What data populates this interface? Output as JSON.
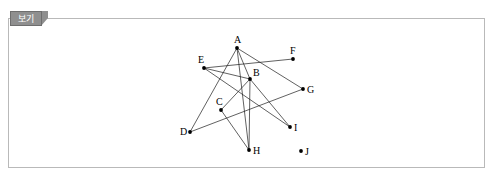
{
  "panel": {
    "tab_label": "보기"
  },
  "graph": {
    "title": "",
    "vertices": [
      {
        "id": "A",
        "label": "A",
        "x": 237,
        "y": 48,
        "label_x": 234,
        "label_y": 43
      },
      {
        "id": "B",
        "label": "B",
        "x": 250,
        "y": 79,
        "label_x": 253,
        "label_y": 76
      },
      {
        "id": "C",
        "label": "C",
        "x": 221,
        "y": 110,
        "label_x": 216,
        "label_y": 105
      },
      {
        "id": "D",
        "label": "D",
        "x": 190,
        "y": 132,
        "label_x": 180,
        "label_y": 135
      },
      {
        "id": "E",
        "label": "E",
        "x": 204,
        "y": 68,
        "label_x": 198,
        "label_y": 63
      },
      {
        "id": "F",
        "label": "F",
        "x": 293,
        "y": 59,
        "label_x": 290,
        "label_y": 54
      },
      {
        "id": "G",
        "label": "G",
        "x": 303,
        "y": 89,
        "label_x": 307,
        "label_y": 93
      },
      {
        "id": "H",
        "label": "H",
        "x": 249,
        "y": 150,
        "label_x": 253,
        "label_y": 154
      },
      {
        "id": "I",
        "label": "I",
        "x": 290,
        "y": 127,
        "label_x": 294,
        "label_y": 131
      },
      {
        "id": "J",
        "label": "J",
        "x": 301,
        "y": 151,
        "label_x": 305,
        "label_y": 155
      }
    ],
    "edges": [
      {
        "from": "A",
        "to": "D"
      },
      {
        "from": "A",
        "to": "B"
      },
      {
        "from": "A",
        "to": "G"
      },
      {
        "from": "A",
        "to": "H"
      },
      {
        "from": "E",
        "to": "F"
      },
      {
        "from": "E",
        "to": "B"
      },
      {
        "from": "E",
        "to": "I"
      },
      {
        "from": "B",
        "to": "C"
      },
      {
        "from": "B",
        "to": "H"
      },
      {
        "from": "B",
        "to": "I"
      },
      {
        "from": "C",
        "to": "H"
      },
      {
        "from": "D",
        "to": "G"
      }
    ],
    "isolated_vertices": [
      "J"
    ],
    "style": {
      "edge_color": "#1c1c1c",
      "node_color": "#000000",
      "background": "#ffffff"
    }
  }
}
